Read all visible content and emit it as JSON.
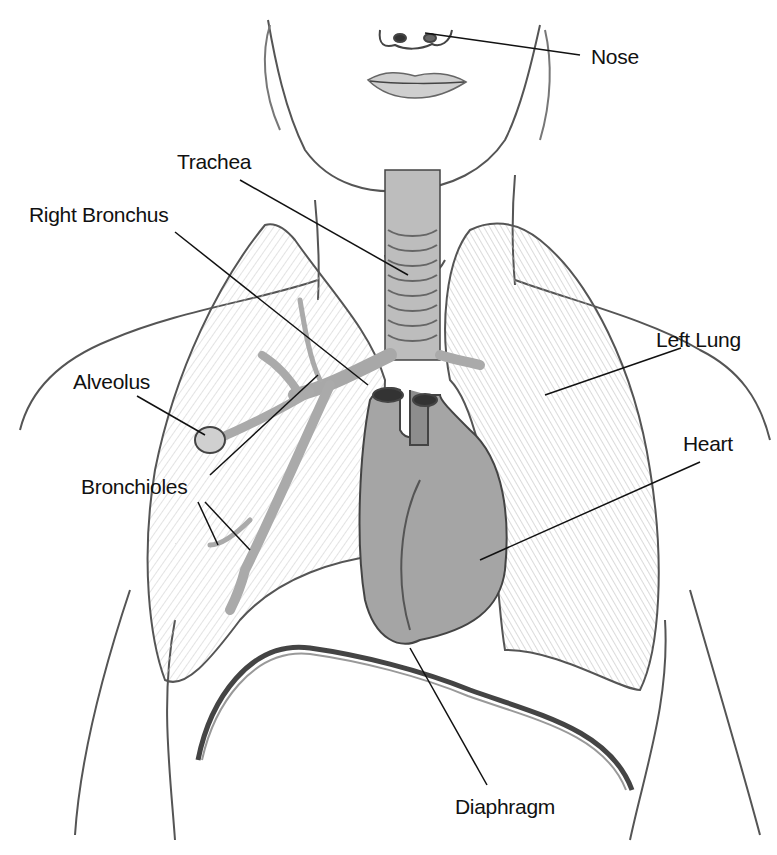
{
  "diagram": {
    "labels": {
      "nose": "Nose",
      "trachea": "Trachea",
      "right_bronchus": "Right Bronchus",
      "alveolus": "Alveolus",
      "bronchioles": "Bronchioles",
      "left_lung": "Left Lung",
      "heart": "Heart",
      "diaphragm": "Diaphragm"
    }
  }
}
